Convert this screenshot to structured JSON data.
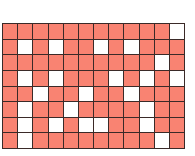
{
  "board": {
    "rows": 8,
    "cols": 12,
    "colors": {
      "filled": "#f98372",
      "empty": "#ffffff",
      "grid_line": "#3a2a28"
    },
    "cells": [
      [
        1,
        1,
        1,
        1,
        1,
        1,
        1,
        1,
        1,
        1,
        1,
        0
      ],
      [
        1,
        0,
        1,
        0,
        1,
        1,
        0,
        1,
        0,
        1,
        1,
        1
      ],
      [
        1,
        1,
        1,
        1,
        1,
        1,
        1,
        1,
        1,
        1,
        0,
        1
      ],
      [
        1,
        0,
        1,
        0,
        1,
        1,
        1,
        0,
        1,
        0,
        1,
        0
      ],
      [
        1,
        1,
        0,
        1,
        1,
        0,
        1,
        1,
        0,
        1,
        1,
        1
      ],
      [
        1,
        0,
        1,
        1,
        0,
        1,
        1,
        1,
        1,
        0,
        1,
        1
      ],
      [
        1,
        0,
        1,
        0,
        1,
        0,
        0,
        1,
        1,
        0,
        1,
        1
      ],
      [
        1,
        0,
        1,
        1,
        1,
        1,
        1,
        1,
        1,
        1,
        0,
        1
      ]
    ]
  }
}
